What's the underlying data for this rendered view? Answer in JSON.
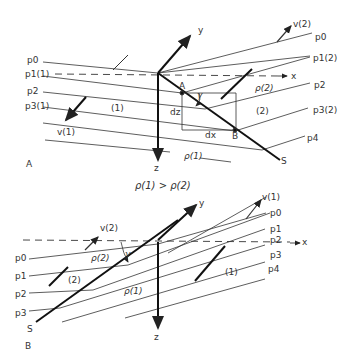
{
  "panel_a": {
    "label": "A",
    "axes": {
      "x": "x",
      "y": "y",
      "z": "z"
    },
    "pressure_labels": [
      "p0",
      "p1(1)",
      "p2",
      "p3(1)"
    ],
    "pressure_labels_right": [
      "p0",
      "p1(2)",
      "p2",
      "p3(2)",
      "p4"
    ],
    "medium_1": "(1)",
    "medium_2": "(2)",
    "velocity_1": "v(1)",
    "velocity_2": "v(2)",
    "density_1": "ρ(1)",
    "density_2": "ρ(2)",
    "point_a": "A",
    "point_b": "B",
    "dz": "dz",
    "dx": "dx",
    "angle": "γ",
    "surface": "S"
  },
  "relation": "ρ(1) > ρ(2)",
  "panel_b": {
    "label": "B",
    "axes": {
      "x": "x",
      "y": "y",
      "z": "z"
    },
    "pressure_labels_left": [
      "p0",
      "p1",
      "p2",
      "p3"
    ],
    "pressure_labels_right": [
      "p0",
      "p1",
      "p2",
      "p3",
      "p4"
    ],
    "medium_1": "(1)",
    "medium_2": "(2)",
    "velocity_1": "v(1)",
    "velocity_2": "v(2)",
    "density_1": "ρ(1)",
    "density_2": "ρ(2)",
    "angle": "γ",
    "surface": "S"
  }
}
